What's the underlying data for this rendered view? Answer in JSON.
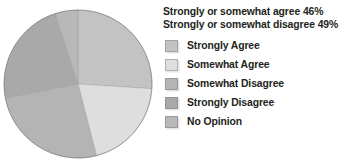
{
  "chart_data": {
    "type": "pie",
    "title": "",
    "summary_lines": [
      "Strongly or somewhat agree 46%",
      "Strongly or somewhat disagree 49%"
    ],
    "categories": [
      "Strongly Agree",
      "Somewhat Agree",
      "Somewhat Disagree",
      "Strongly Disagree",
      "No Opinion"
    ],
    "values": [
      26,
      20,
      26,
      23,
      5
    ],
    "value_unit": "%",
    "colors": [
      "#c3c3c3",
      "#dedede",
      "#b4b4b4",
      "#a9a9a9",
      "#b8b8b8"
    ],
    "legend_position": "right",
    "grid": false,
    "start_angle_deg": 0,
    "direction": "clockwise"
  },
  "legend": {
    "items": [
      {
        "label": "Strongly Agree",
        "color": "#c3c3c3"
      },
      {
        "label": "Somewhat Agree",
        "color": "#dedede"
      },
      {
        "label": "Somewhat Disagree",
        "color": "#b4b4b4"
      },
      {
        "label": "Strongly Disagree",
        "color": "#a9a9a9"
      },
      {
        "label": "No Opinion",
        "color": "#b8b8b8"
      }
    ]
  },
  "summary": {
    "agree": "Strongly or somewhat agree 46%",
    "disagree": "Strongly or somewhat disagree 49%"
  }
}
